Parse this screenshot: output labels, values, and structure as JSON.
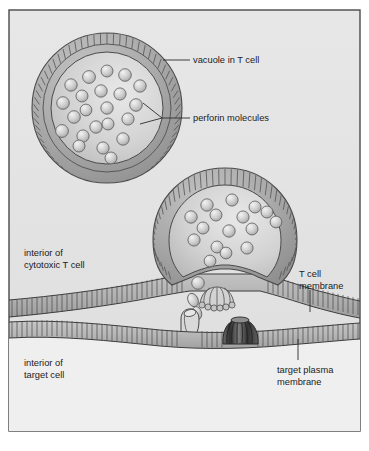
{
  "figure": {
    "type": "biological-cell-diagram",
    "frame": {
      "border_color": "#4a4a4a",
      "background_color": "#e9e9e9"
    },
    "colors": {
      "outer_margin": "#ffffff",
      "t_cell_interior": "#e4e4e4",
      "target_cell_interior": "#eeeeee",
      "vacuole_membrane_fill": "#a8a8a8",
      "vacuole_lumen": "#d6d6d6",
      "membrane_band_fill": "#b5b5b5",
      "perforin_sphere": "#cfcfcf",
      "assembled_pore_dark": "#4f4f4f",
      "assembled_pore_light": "#c7c7c7",
      "outline": "#3c3c3c",
      "label_text": "#1b1b1b"
    },
    "labels": [
      {
        "id": "vacuole-in-t-cell",
        "text": "vacuole in T cell",
        "x": 193,
        "y": 63,
        "anchor": "start",
        "lines": [
          "vacuole in T cell"
        ]
      },
      {
        "id": "perforin-molecules",
        "text": "perforin molecules",
        "x": 193,
        "y": 121,
        "anchor": "start",
        "lines": [
          "perforin molecules"
        ]
      },
      {
        "id": "interior-of-cytotoxic-t-cell",
        "text": "interior of cytotoxic T cell",
        "x": 24,
        "y": 256,
        "anchor": "start",
        "lines": [
          "interior of",
          "cytotoxic T cell"
        ]
      },
      {
        "id": "t-cell-membrane",
        "text": "T cell membrane",
        "x": 299,
        "y": 277,
        "anchor": "start",
        "lines": [
          "T cell",
          "membrane"
        ]
      },
      {
        "id": "interior-of-target-cell",
        "text": "interior of target cell",
        "x": 24,
        "y": 366,
        "anchor": "start",
        "lines": [
          "interior of",
          "target cell"
        ]
      },
      {
        "id": "target-plasma-membrane",
        "text": "target plasma membrane",
        "x": 277,
        "y": 373,
        "anchor": "start",
        "lines": [
          "target plasma",
          "membrane"
        ]
      }
    ],
    "structures": {
      "upper_vacuole": {
        "name": "vacuole in T cell",
        "center_x": 107,
        "center_y": 108,
        "outer_radius": 75,
        "lumen_radius": 56,
        "perforin_count": 22
      },
      "lower_vacuole": {
        "name": "vacuole fusing with T cell membrane",
        "center_x": 225,
        "center_y": 240,
        "outer_radius": 72,
        "lumen_radius": 55,
        "perforin_count": 16
      },
      "t_cell_membrane": {
        "name": "T cell membrane",
        "hatch_count": 96
      },
      "target_plasma_membrane": {
        "name": "target plasma membrane",
        "hatch_count": 96
      },
      "released_perforin_count": 4,
      "assembling_pore": {
        "name": "assembling polyperforin complex",
        "x": 216,
        "y": 297
      },
      "inserting_pore": {
        "name": "partially inserted perforin pore",
        "x": 186,
        "y": 324
      },
      "inserted_pore": {
        "name": "assembled transmembrane pore in target membrane",
        "x": 239,
        "y": 330
      }
    }
  }
}
